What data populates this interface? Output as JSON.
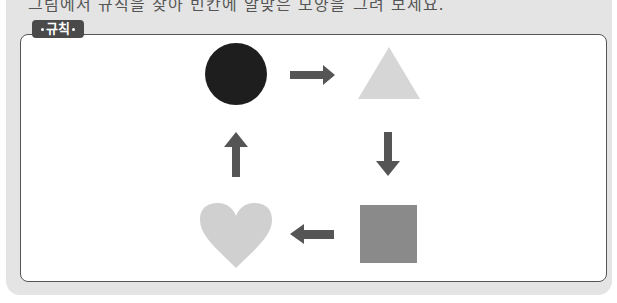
{
  "header": {
    "instruction_text": "그림에서 규칙을 찾아 빈칸에 알맞은 모양을 그려 보세요."
  },
  "rule_box": {
    "label": "규칙",
    "sequence": [
      {
        "shape": "circle",
        "color": "#1e1e1e"
      },
      {
        "shape": "triangle",
        "color": "#d6d6d6"
      },
      {
        "shape": "square",
        "color": "#8a8a8a"
      },
      {
        "shape": "heart",
        "color": "#d0d0d0"
      }
    ],
    "arrows": [
      {
        "direction": "right",
        "color": "#555555"
      },
      {
        "direction": "down",
        "color": "#555555"
      },
      {
        "direction": "left",
        "color": "#555555"
      },
      {
        "direction": "up",
        "color": "#555555"
      }
    ]
  }
}
